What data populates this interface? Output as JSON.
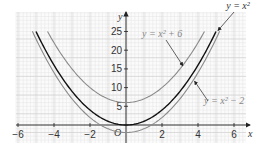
{
  "chart_data": {
    "type": "line",
    "title": "",
    "xlabel": "x",
    "ylabel": "y",
    "origin_label": "O",
    "xlim": [
      -6,
      6.5
    ],
    "ylim": [
      -2.5,
      27
    ],
    "grid": true,
    "x_ticks": [
      -6,
      -4,
      -2,
      2,
      4,
      6
    ],
    "x_tick_labels": [
      "−6",
      "−4",
      "−2",
      "2",
      "4",
      "6"
    ],
    "y_ticks": [
      5,
      10,
      15,
      20,
      25
    ],
    "y_tick_labels": [
      "5",
      "10",
      "15",
      "20",
      "25"
    ],
    "series": [
      {
        "name": "y = x² + 6",
        "label": "y = x² + 6",
        "offset": 6,
        "color": "#8a8a8a",
        "x_range": [
          -4.36,
          4.36
        ]
      },
      {
        "name": "y = x²",
        "label": "y = x²",
        "offset": 0,
        "color": "#111111",
        "x_range": [
          -5,
          5
        ]
      },
      {
        "name": "y = x² − 2",
        "label": "y = x² − 2",
        "offset": -2,
        "color": "#8a8a8a",
        "x_range": [
          -5.2,
          5.2
        ]
      }
    ],
    "annotations": [
      {
        "text": "y = x²",
        "arrow_to": [
          5.0,
          25
        ]
      },
      {
        "text": "y = x² + 6",
        "arrow_to": [
          3.1,
          15.6
        ]
      },
      {
        "text": "y = x² − 2",
        "arrow_to": [
          3.7,
          11.7
        ]
      }
    ]
  }
}
